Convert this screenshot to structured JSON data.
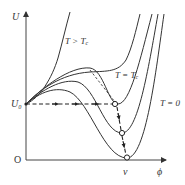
{
  "diagram": {
    "type": "potential-curves",
    "axes": {
      "y_label": "U",
      "x_label": "ϕ",
      "origin_label": "O",
      "y_tick_label": "U₀",
      "x_tick_label": "v"
    },
    "curve_labels": {
      "hot": "T > T",
      "hot_sub": "c",
      "critical": "T = T",
      "critical_sub": "c",
      "zero": "T = 0"
    },
    "curves": [
      {
        "name": "T > Tc",
        "shape": "monotonic rising"
      },
      {
        "name": "T = Tc",
        "shape": "inflection / degenerate minimum"
      },
      {
        "name": "intermediate-1",
        "shape": "local max then minimum at U0"
      },
      {
        "name": "intermediate-2",
        "shape": "minimum below U0"
      },
      {
        "name": "T = 0",
        "shape": "global minimum at v, U=0"
      }
    ],
    "markers": {
      "minima_points": 3,
      "style": "open circle",
      "path": "dashed arrows from U0 horizontally to minimum, then down to v"
    },
    "colors": {
      "line": "#333333",
      "background": "#ffffff"
    }
  }
}
